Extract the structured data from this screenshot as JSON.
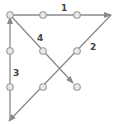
{
  "diagram": {
    "title": "",
    "line_color": "#8a8a8a",
    "dot_color": "#9a9a9a",
    "dot_fill": "#e8e8e8",
    "dots": [
      {
        "x": 10,
        "y": 15
      },
      {
        "x": 43,
        "y": 15
      },
      {
        "x": 77,
        "y": 15
      },
      {
        "x": 10,
        "y": 51
      },
      {
        "x": 43,
        "y": 51
      },
      {
        "x": 77,
        "y": 51
      },
      {
        "x": 10,
        "y": 87
      },
      {
        "x": 43,
        "y": 87
      },
      {
        "x": 77,
        "y": 87
      }
    ],
    "segments": [
      {
        "label": "1",
        "x1": 10,
        "y1": 15,
        "x2": 111,
        "y2": 15,
        "lx": 61,
        "ly": 11
      },
      {
        "label": "2",
        "x1": 111,
        "y1": 15,
        "x2": 9,
        "y2": 121,
        "lx": 90,
        "ly": 50
      },
      {
        "label": "3",
        "x1": 10,
        "y1": 121,
        "x2": 10,
        "y2": 17,
        "lx": 13,
        "ly": 76
      },
      {
        "label": "4",
        "x1": 10,
        "y1": 15,
        "x2": 73,
        "y2": 83,
        "lx": 37,
        "ly": 41
      }
    ]
  }
}
